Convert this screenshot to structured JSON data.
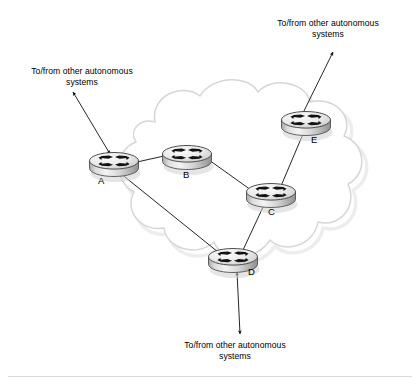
{
  "figure": {
    "type": "network-topology",
    "title": ""
  },
  "cloud": {
    "name": "autonomous-system-cloud",
    "outline_color": "#d8d8d8",
    "shadow_color": "#e9e9e9",
    "fill_color": "#ffffff"
  },
  "routers": [
    {
      "id": "A",
      "label": "A",
      "x": 114,
      "y": 163,
      "label_x": 98,
      "label_y": 180,
      "icon": "router-icon"
    },
    {
      "id": "B",
      "label": "B",
      "x": 187,
      "y": 156,
      "label_x": 183,
      "label_y": 175,
      "icon": "router-icon"
    },
    {
      "id": "C",
      "label": "C",
      "x": 271,
      "y": 194,
      "label_x": 268,
      "label_y": 211,
      "icon": "router-icon"
    },
    {
      "id": "D",
      "label": "D",
      "x": 233,
      "y": 259,
      "label_x": 248,
      "label_y": 271,
      "icon": "router-icon"
    },
    {
      "id": "E",
      "label": "E",
      "x": 306,
      "y": 122,
      "label_x": 312,
      "label_y": 139,
      "icon": "router-icon"
    }
  ],
  "links": [
    {
      "name": "link-a-b",
      "from": "A",
      "to": "B"
    },
    {
      "name": "link-b-c",
      "from": "B",
      "to": "C"
    },
    {
      "name": "link-a-d",
      "from": "A",
      "to": "D"
    },
    {
      "name": "link-c-d",
      "from": "C",
      "to": "D"
    },
    {
      "name": "link-c-e",
      "from": "C",
      "to": "E"
    }
  ],
  "external_connections": [
    {
      "name": "external-link-a",
      "router": "A",
      "label": "To/from other autonomous\nsystems",
      "direction": "up-left",
      "arrowheads": "both"
    },
    {
      "name": "external-link-e",
      "router": "E",
      "label": "To/from other autonomous\nsystems",
      "direction": "up-right",
      "arrowheads": "both"
    },
    {
      "name": "external-link-d",
      "router": "D",
      "label": "To/from other autonomous\nsystems",
      "direction": "down",
      "arrowheads": "both"
    }
  ],
  "colors": {
    "line": "#1a1a1a",
    "text": "#000000",
    "router_body_light": "#f2f2f2",
    "router_body_mid": "#c9c9c9",
    "router_body_dark": "#9a9a9a",
    "router_top_fill": "#e4e4e4",
    "router_symbol": "#111111",
    "cloud_stroke": "#d8d8d8",
    "footer_rule": "#d9d9d9",
    "background": "#ffffff"
  },
  "footer_rule": {
    "name": "footer-divider",
    "visible": true
  }
}
